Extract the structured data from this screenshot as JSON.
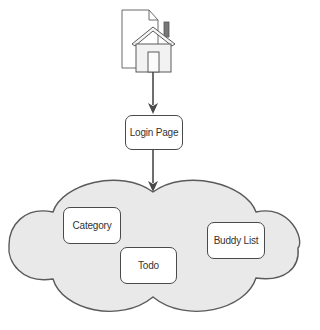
{
  "diagram": {
    "type": "flowchart",
    "colors": {
      "stroke": "#4a4a4a",
      "cloud_fill": "#e9e9e9",
      "node_fill": "#ffffff",
      "text": "#333333",
      "house_fill": "#f2f2f2",
      "chimney": "#777777"
    },
    "icon": {
      "name": "home-page-icon",
      "description": "Document page with house"
    },
    "nodes": [
      {
        "id": "login",
        "label": "Login Page"
      },
      {
        "id": "category",
        "label": "Category"
      },
      {
        "id": "todo",
        "label": "Todo"
      },
      {
        "id": "buddy",
        "label": "Buddy List"
      }
    ],
    "group": {
      "id": "app-cloud",
      "shape": "cloud",
      "contains": [
        "category",
        "todo",
        "buddy"
      ]
    },
    "edges": [
      {
        "from": "home-page-icon",
        "to": "login"
      },
      {
        "from": "login",
        "to": "app-cloud"
      }
    ]
  }
}
